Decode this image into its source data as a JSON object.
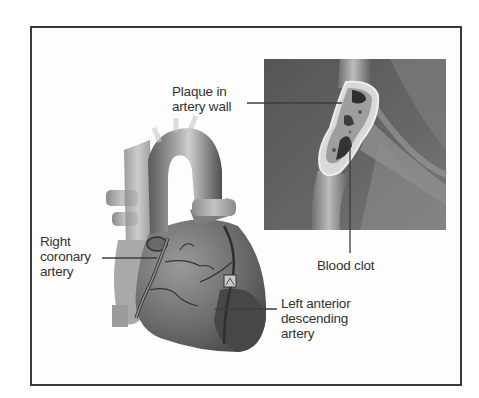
{
  "figure": {
    "labels": {
      "plaque": "Plaque in\nartery wall",
      "right_coronary": "Right\ncoronary\nartery",
      "blood_clot": "Blood clot",
      "lad": "Left anterior\ndescending\nartery"
    },
    "panels": {
      "main": "heart-anterior-view",
      "inset": "artery-cross-section"
    },
    "colors": {
      "frame": "#3a3a3a",
      "inset_bg": "#5e5e5e",
      "heart_dark": "#4a4a4a",
      "heart_mid": "#7a7a7a",
      "heart_light": "#b5b5b5",
      "text": "#333333"
    }
  }
}
